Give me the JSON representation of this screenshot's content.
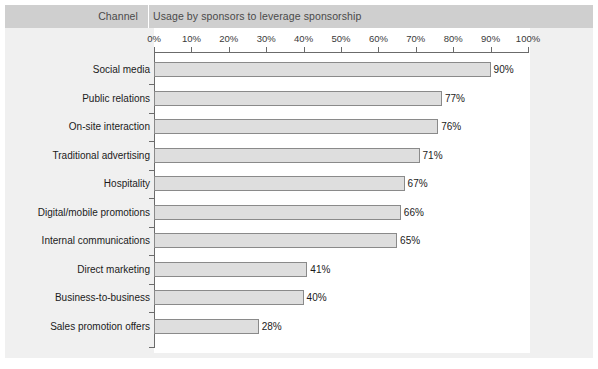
{
  "header": {
    "channel_label": "Channel",
    "usage_label": "Usage by sponsors to leverage sponsorship"
  },
  "colors": {
    "panel_background": "#f0f0f0",
    "header_band": "#cfcfcf",
    "plot_background": "#ffffff",
    "bar_fill": "#dedede",
    "bar_border": "#8a8a8a",
    "axis": "#6b6b6b",
    "text": "#1b1b1b"
  },
  "chart_data": {
    "type": "bar",
    "orientation": "horizontal",
    "title": "Usage by sponsors to leverage sponsorship",
    "xlabel": "",
    "ylabel": "Channel",
    "xlim": [
      0,
      100
    ],
    "grid": false,
    "legend": "none",
    "tick_labels": [
      "0%",
      "10%",
      "20%",
      "30%",
      "40%",
      "50%",
      "60%",
      "70%",
      "80%",
      "90%",
      "100%"
    ],
    "tick_values": [
      0,
      10,
      20,
      30,
      40,
      50,
      60,
      70,
      80,
      90,
      100
    ],
    "categories": [
      "Social media",
      "Public relations",
      "On-site interaction",
      "Traditional advertising",
      "Hospitality",
      "Digital/mobile promotions",
      "Internal communications",
      "Direct marketing",
      "Business-to-business",
      "Sales promotion offers"
    ],
    "values": [
      90,
      77,
      76,
      71,
      67,
      66,
      65,
      41,
      40,
      28
    ],
    "value_labels": [
      "90%",
      "77%",
      "76%",
      "71%",
      "67%",
      "66%",
      "65%",
      "41%",
      "40%",
      "28%"
    ]
  }
}
